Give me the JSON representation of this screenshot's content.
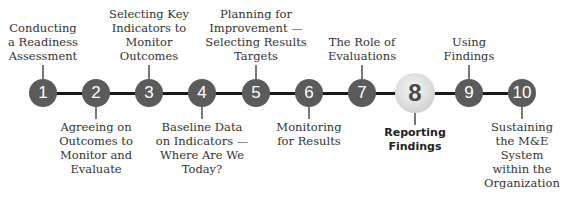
{
  "diagram": {
    "type": "timeline",
    "highlighted_step": "8",
    "colors": {
      "node": "#5b5b5b",
      "highlight_node": "#dcdcdc",
      "line": "#1a1a1a",
      "text": "#333333"
    },
    "steps": [
      {
        "num": "1",
        "label": "Conducting a Readiness Assessment",
        "position": "above"
      },
      {
        "num": "2",
        "label": "Agreeing on Outcomes to Monitor and Evaluate",
        "position": "below"
      },
      {
        "num": "3",
        "label": "Selecting Key Indicators to Monitor Outcomes",
        "position": "above"
      },
      {
        "num": "4",
        "label": "Baseline Data on Indicators — Where Are We Today?",
        "position": "below"
      },
      {
        "num": "5",
        "label": "Planning for Improvement — Selecting Results Targets",
        "position": "above"
      },
      {
        "num": "6",
        "label": "Monitoring for Results",
        "position": "below"
      },
      {
        "num": "7",
        "label": "The Role of Evaluations",
        "position": "above"
      },
      {
        "num": "8",
        "label": "Reporting Findings",
        "position": "below"
      },
      {
        "num": "9",
        "label": "Using Findings",
        "position": "above"
      },
      {
        "num": "10",
        "label": "Sustaining the M&E System within the Organization",
        "position": "below"
      }
    ]
  }
}
